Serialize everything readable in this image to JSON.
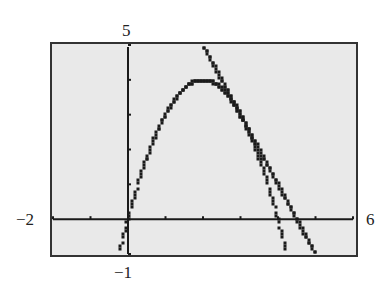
{
  "chart_data": {
    "type": "line",
    "title": "",
    "xlabel": "",
    "ylabel": "",
    "xlim": [
      -2,
      6
    ],
    "ylim": [
      -1,
      5
    ],
    "xscale": 1,
    "yscale": 1,
    "grid": false,
    "legend": null,
    "window_labels": {
      "xmin": "−2",
      "xmax": "6",
      "ymin": "−1",
      "ymax": "5"
    },
    "series": [
      {
        "name": "parabola",
        "expression": "y = -x^2 + 4x",
        "style": "dotted-pixel",
        "x": [
          -0.23,
          0,
          0.5,
          1,
          1.5,
          2,
          2.5,
          3,
          3.5,
          4,
          4.5
        ],
        "y": [
          -1,
          0,
          1.75,
          3,
          3.75,
          4,
          3.75,
          3,
          1.75,
          0,
          -2.25
        ]
      },
      {
        "name": "tangent line at x=3",
        "expression": "y = -2x + 9",
        "style": "dotted-pixel",
        "x": [
          2,
          3,
          4,
          4.5,
          5
        ],
        "y": [
          5,
          3,
          1,
          0,
          -1
        ]
      }
    ],
    "annotations": [
      {
        "text": "point of tangency",
        "x": 3,
        "y": 3
      }
    ]
  },
  "colors": {
    "screen_bg": "#e9e9e9",
    "frame": "#333333",
    "ink": "#1a1a1a"
  }
}
